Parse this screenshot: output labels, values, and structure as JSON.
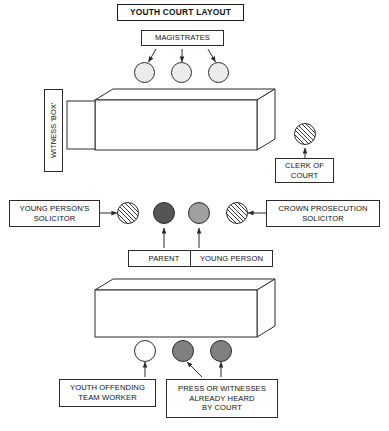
{
  "diagram": {
    "title": "YOUTH COURT LAYOUT",
    "type": "courtroom-layout",
    "background_color": "#ffffff",
    "line_color": "#2b2b2b",
    "text_color": "#111111"
  },
  "labels": {
    "title": "YOUTH COURT LAYOUT",
    "magistrates": "MAGISTRATES",
    "witness_box": "WITNESS 'BOX'",
    "clerk_of_court": "CLERK OF\nCOURT",
    "young_persons_solicitor": "YOUNG PERSON'S\nSOLICITOR",
    "crown_prosecution_solicitor": "CROWN PROSECUTION\nSOLICITOR",
    "parent": "PARENT",
    "young_person": "YOUNG PERSON",
    "youth_offending_team_worker": "YOUTH OFFENDING\nTEAM WORKER",
    "press_or_witnesses": "PRESS OR WITNESSES\nALREADY HEARD\nBY COURT"
  },
  "seats": {
    "magistrates": [
      {
        "name": "magistrate-1",
        "fill": "#ececec"
      },
      {
        "name": "magistrate-2",
        "fill": "#ececec"
      },
      {
        "name": "magistrate-3",
        "fill": "#ececec"
      }
    ],
    "clerk": {
      "name": "clerk-of-court",
      "fill": "hatched"
    },
    "middle_row": [
      {
        "name": "young-persons-solicitor",
        "fill": "hatched"
      },
      {
        "name": "parent",
        "fill": "#555555"
      },
      {
        "name": "young-person",
        "fill": "#a0a0a0"
      },
      {
        "name": "crown-prosecution-solicitor",
        "fill": "hatched"
      }
    ],
    "back_row": [
      {
        "name": "youth-offending-team-worker",
        "fill": "#ffffff"
      },
      {
        "name": "press-or-witness-1",
        "fill": "#808080"
      },
      {
        "name": "press-or-witness-2",
        "fill": "#808080"
      }
    ]
  },
  "benches": [
    {
      "name": "magistrates-bench",
      "fill": "#ffffff"
    },
    {
      "name": "public-gallery-bench",
      "fill": "#ffffff"
    }
  ]
}
